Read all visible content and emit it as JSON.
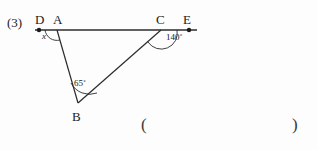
{
  "problem": {
    "number": "(3)"
  },
  "figure": {
    "type": "geometry-diagram",
    "points": {
      "D": {
        "x": 39,
        "y": 30,
        "label": "D",
        "has_dot": true
      },
      "A": {
        "x": 57,
        "y": 30,
        "label": "A",
        "has_dot": false
      },
      "C": {
        "x": 161,
        "y": 30,
        "label": "C",
        "has_dot": false
      },
      "E": {
        "x": 189,
        "y": 30,
        "label": "E",
        "has_dot": true
      },
      "B": {
        "x": 78,
        "y": 103,
        "label": "B",
        "has_dot": false
      }
    },
    "segments": [
      {
        "name": "line-DE",
        "from": "D",
        "to": "E"
      },
      {
        "name": "segment-AB",
        "from": "A",
        "to": "B"
      },
      {
        "name": "segment-BC",
        "from": "B",
        "to": "C"
      }
    ],
    "angles": [
      {
        "name": "angle-x-at-A",
        "vertex": "A",
        "label": "x",
        "value": null
      },
      {
        "name": "angle-B",
        "vertex": "B",
        "label": "65˚",
        "value": 65
      },
      {
        "name": "angle-BCE",
        "vertex": "C",
        "label": "140˚",
        "value": 140
      }
    ]
  },
  "answer": {
    "open_paren": "(",
    "close_paren": ")",
    "value": ""
  },
  "colors": {
    "ink": "#1b1b1b",
    "line": "#2b2b2b",
    "background": "#fdfdfd"
  }
}
